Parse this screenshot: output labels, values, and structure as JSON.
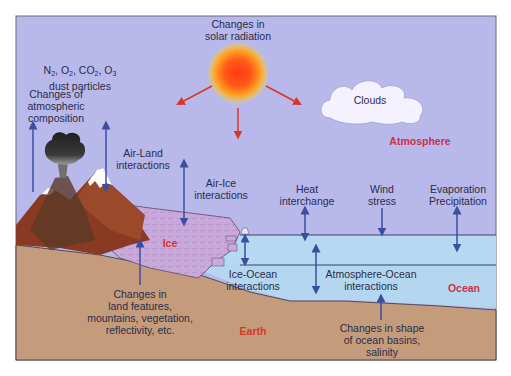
{
  "diagram": {
    "colors": {
      "atmosphere": "#b8b8ea",
      "ocean": "#b4d6ef",
      "earth": "#c49c7c",
      "ice": "#c9a8da",
      "arrow_blue": "#3a4fa0",
      "arrow_red": "#d8362a",
      "zone_label_red": "#c8334a",
      "mountain": "#8a3a22",
      "cloud": "#f4f2ff"
    },
    "zones": {
      "atmosphere": "Atmosphere",
      "ocean": "Ocean",
      "earth": "Earth",
      "ice": "Ice"
    },
    "labels": {
      "solar": "Changes in\nsolar radiation",
      "gases_line1": [
        "N",
        "2",
        ", O",
        "2",
        ", CO",
        "2",
        ", O",
        "3"
      ],
      "gases_line2": "dust particles",
      "atm_composition": "Changes of\natmospheric\ncomposition",
      "air_land": "Air-Land\ninteractions",
      "air_ice": "Air-Ice\ninteractions",
      "clouds": "Clouds",
      "heat": "Heat\ninterchange",
      "wind": "Wind\nstress",
      "evap": "Evaporation\nPrecipitation",
      "ice_ocean": "Ice-Ocean\ninteractions",
      "atm_ocean": "Atmosphere-Ocean\ninteractions",
      "land_features": "Changes in\nland features,\nmountains, vegetation,\nreflectivity, etc.",
      "ocean_basins": "Changes in shape\nof ocean basins,\nsalinity"
    },
    "icons": [
      "sun-icon",
      "cloud-icon",
      "volcano-icon",
      "mountain-icon",
      "ice-sheet-icon"
    ]
  }
}
